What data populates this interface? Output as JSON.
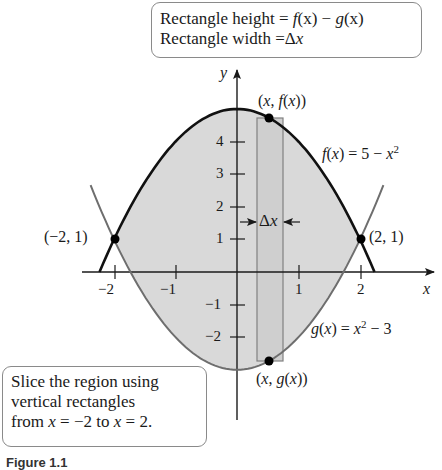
{
  "figure": {
    "top_callout": {
      "line1": "Rectangle height = f(x) − g(x)",
      "line1_parts": {
        "prefix": "Rectangle height = ",
        "f": "f",
        "fx": "(x)",
        "minus": " − ",
        "g": "g",
        "gx": "(x)"
      },
      "line2": "Rectangle width = Δx",
      "line2_parts": {
        "prefix": "Rectangle width =",
        "delta": "Δ",
        "x": "x"
      }
    },
    "bottom_callout": {
      "line1": "Slice the region using",
      "line2": "vertical rectangles",
      "line3": "from x = −2 to x = 2.",
      "line3_parts": {
        "a": "from ",
        "x1": "x",
        "b": " = −2 to ",
        "x2": "x",
        "c": " = 2."
      }
    },
    "labels": {
      "point_top": "(x, f(x))",
      "point_bottom": "(x, g(x))",
      "point_left": "(−2, 1)",
      "point_right": "(2, 1)",
      "f_label": "f(x) = 5 − x²",
      "g_label": "g(x) = x² − 3",
      "delta_x": "Δx",
      "x_axis": "x",
      "y_axis": "y"
    },
    "x_ticks": [
      "−2",
      "−1",
      "1",
      "2"
    ],
    "y_ticks": [
      "4",
      "3",
      "2",
      "1",
      "−1",
      "−2"
    ],
    "caption": "Figure 1.1"
  },
  "chart_data": {
    "type": "area",
    "xlabel": "x",
    "ylabel": "y",
    "xlim": [
      -2.6,
      3.2
    ],
    "ylim": [
      -4.5,
      5.5
    ],
    "x_ticks": [
      -2,
      -1,
      1,
      2
    ],
    "y_ticks": [
      -2,
      -1,
      1,
      2,
      3,
      4
    ],
    "series": [
      {
        "name": "f(x) = 5 − x²",
        "style": "thick black",
        "x": [
          -2.24,
          -2,
          -1.5,
          -1,
          -0.5,
          0,
          0.5,
          1,
          1.5,
          2,
          2.24
        ],
        "y": [
          0,
          1,
          2.75,
          4,
          4.75,
          5,
          4.75,
          4,
          2.75,
          1,
          0
        ]
      },
      {
        "name": "g(x) = x² − 3",
        "style": "gray",
        "x": [
          -2.4,
          -2,
          -1.5,
          -1,
          -0.5,
          0,
          0.5,
          1,
          1.5,
          2,
          2.4
        ],
        "y": [
          2.76,
          1,
          -0.75,
          -2,
          -2.75,
          -3,
          -2.75,
          -2,
          -0.75,
          1,
          2.76
        ]
      }
    ],
    "shaded_region": {
      "from_x": -2,
      "to_x": 2,
      "between": [
        "f",
        "g"
      ]
    },
    "intersection_points": [
      {
        "x": -2,
        "y": 1,
        "label": "(−2, 1)"
      },
      {
        "x": 2,
        "y": 1,
        "label": "(2, 1)"
      }
    ],
    "representative_rectangle": {
      "x_left": 0.33,
      "x_right": 0.75,
      "y_top": 4.7,
      "y_bottom": -2.74,
      "label_width": "Δx"
    },
    "highlighted_points": [
      {
        "x": 0.52,
        "y": 4.73,
        "label": "(x, f(x))"
      },
      {
        "x": 0.52,
        "y": -2.73,
        "label": "(x, g(x))"
      }
    ],
    "grid": false
  }
}
